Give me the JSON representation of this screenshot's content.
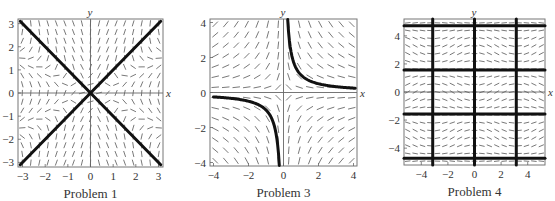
{
  "chart_data": [
    {
      "type": "slope_field",
      "title": "Problem 1",
      "xlabel": "x",
      "ylabel": "y",
      "xlim": [
        -3.2,
        3.2
      ],
      "ylim": [
        -3.2,
        3.2
      ],
      "xticks": [
        -3,
        -2,
        -1,
        0,
        1,
        2,
        3
      ],
      "yticks": [
        -3,
        -2,
        -1,
        0,
        1,
        2,
        3
      ],
      "field": "p1",
      "grid_n": 17,
      "solution_curves": [
        {
          "label": "y = x",
          "points": [
            [
              -3.1,
              -3.1
            ],
            [
              3.1,
              3.1
            ]
          ]
        },
        {
          "label": "y = -x",
          "points": [
            [
              -3.1,
              3.1
            ],
            [
              3.1,
              -3.1
            ]
          ]
        }
      ],
      "box": {
        "x": 18,
        "y": 19,
        "w": 145,
        "h": 148
      }
    },
    {
      "type": "slope_field",
      "title": "Problem 3",
      "xlabel": "x",
      "ylabel": "y",
      "xlim": [
        -4.2,
        4.2
      ],
      "ylim": [
        -4.2,
        4.2
      ],
      "xticks": [
        -4,
        -2,
        0,
        2,
        4
      ],
      "yticks": [
        -4,
        -2,
        0,
        2,
        4
      ],
      "field": "p3",
      "grid_n": 14,
      "solution_curves": [
        {
          "label": "y = 1/x (x>0)",
          "fn": "recip",
          "range": [
            0.24,
            4.1
          ]
        },
        {
          "label": "y = 1/x (x<0)",
          "fn": "recip",
          "range": [
            -4.0,
            -0.24
          ]
        }
      ],
      "box": {
        "x": 210,
        "y": 19,
        "w": 147,
        "h": 147
      }
    },
    {
      "type": "slope_field",
      "title": "Problem 4",
      "xlabel": "x",
      "ylabel": "y",
      "xlim": [
        -5.3,
        5.3
      ],
      "ylim": [
        -5.2,
        5.2
      ],
      "xticks": [
        -4,
        -2,
        0,
        2,
        4
      ],
      "yticks": [
        -4,
        -2,
        0,
        2,
        4
      ],
      "field": "p4",
      "grid_n": 19,
      "vertical_lines": [
        -3.1416,
        0,
        3.1416
      ],
      "horizontal_lines": [
        -4.7124,
        -1.5708,
        1.5708,
        4.7124
      ],
      "box": {
        "x": 404,
        "y": 19,
        "w": 141,
        "h": 146
      }
    }
  ],
  "labels": {
    "p1": "Problem 1",
    "p3": "Problem 3",
    "p4": "Problem 4"
  }
}
